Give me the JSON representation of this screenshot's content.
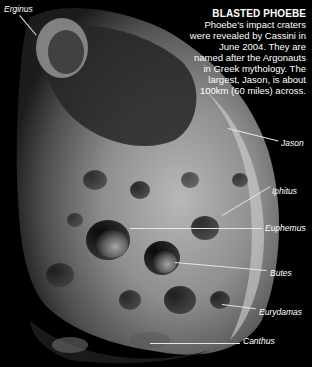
{
  "caption": {
    "title": "BLASTED PHOEBE",
    "body": "Phoebe's impact craters were revealed by Cassini in June 2004. They are named after the Argonauts in Greek mythology. The largest, Jason, is about 100km (60 miles) across."
  },
  "labels": {
    "erginus": "Erginus",
    "jason": "Jason",
    "iphitus": "Iphitus",
    "euphemus": "Euphemus",
    "butes": "Butes",
    "eurydamas": "Eurydamas",
    "canthus": "Canthus"
  },
  "colors": {
    "background": "#000000",
    "text": "#ffffff",
    "moon_light": "#c9c9c9",
    "moon_mid": "#8a8a8a",
    "moon_dark": "#3a3a3a"
  }
}
